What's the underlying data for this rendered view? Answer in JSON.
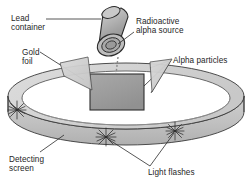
{
  "figure": {
    "background_color": "#ffffff",
    "line_color": "#262626",
    "text_color": "#262626"
  },
  "labels": {
    "lead_container": "Lead\ncontainer",
    "alpha_source": "Radioactive\nalpha source",
    "gold_foil": "Gold\nfoil",
    "alpha_particles": "Alpha particles",
    "detecting_screen": "Detecting\nscreen",
    "light_flashes": "Light flashes"
  },
  "parts": {
    "lead_container": {
      "name": "lead-container-cylinder",
      "shape": "tilted-cylinder",
      "fill": "#b5b5b5",
      "stroke": "#2b2b2b"
    },
    "alpha_source": {
      "name": "alpha-source-aperture",
      "shape": "concentric-ellipses",
      "ring_count": 3,
      "fill": "#9a9a9a",
      "stroke": "#2b2b2b"
    },
    "gold_foil": {
      "name": "gold-foil-sheet",
      "shape": "rectangle",
      "fill": "#9e9e9e",
      "stroke": "#2e2e2e"
    },
    "detecting_screen": {
      "name": "detecting-screen-ring",
      "shape": "elliptical-band",
      "fill_top": "#d6d6d6",
      "fill_side": "#c4c4c4",
      "stroke": "#3a3a3a"
    },
    "light_flashes": {
      "name": "light-flash-starbursts",
      "shape": "starburst",
      "count": 3,
      "stroke": "#2b2b2b"
    },
    "alpha_beam": {
      "name": "alpha-beam",
      "shape": "dashed-line",
      "stroke": "#7a7a7a"
    }
  },
  "colors": {
    "ink": "#262626",
    "metal_light": "#d6d6d6",
    "metal_mid": "#b5b5b5",
    "metal_dark": "#8f8f8f"
  }
}
